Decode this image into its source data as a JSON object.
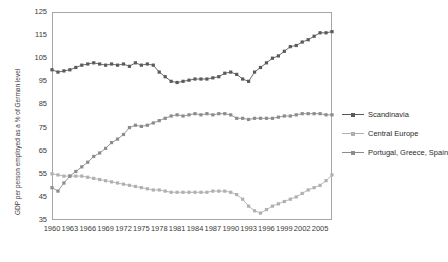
{
  "chart_data": {
    "type": "line",
    "title": "",
    "xlabel": "",
    "ylabel": "GDP per person employed as a % of German level",
    "ylim": [
      35,
      125
    ],
    "yticks": [
      35,
      45,
      55,
      65,
      75,
      85,
      95,
      105,
      115,
      125
    ],
    "xlim": [
      1960,
      2007
    ],
    "xticks": [
      1960,
      1963,
      1966,
      1969,
      1972,
      1975,
      1978,
      1981,
      1984,
      1987,
      1990,
      1993,
      1996,
      1999,
      2002,
      2005
    ],
    "grid": "horizontal",
    "legend_position": "right",
    "x": [
      1960,
      1961,
      1962,
      1963,
      1964,
      1965,
      1966,
      1967,
      1968,
      1969,
      1970,
      1971,
      1972,
      1973,
      1974,
      1975,
      1976,
      1977,
      1978,
      1979,
      1980,
      1981,
      1982,
      1983,
      1984,
      1985,
      1986,
      1987,
      1988,
      1989,
      1990,
      1991,
      1992,
      1993,
      1994,
      1995,
      1996,
      1997,
      1998,
      1999,
      2000,
      2001,
      2002,
      2003,
      2004,
      2005,
      2006,
      2007
    ],
    "series": [
      {
        "name": "Scandinavia",
        "color": "#5a5a5a",
        "values": [
          100,
          99,
          99.5,
          100,
          101,
          102,
          102.5,
          103,
          102.5,
          102,
          102.5,
          102,
          102.5,
          101.5,
          103,
          102,
          102.5,
          102,
          99,
          97,
          95,
          94.5,
          95,
          95.5,
          96,
          96,
          96,
          96.5,
          97,
          98.5,
          99,
          98,
          96,
          95,
          99,
          101,
          103,
          105,
          106,
          108,
          110,
          110.5,
          112,
          113,
          114.5,
          116,
          116,
          116.5
        ]
      },
      {
        "name": "Central Europe",
        "color": "#b0b0b0",
        "values": [
          55,
          54.5,
          54,
          54,
          54,
          54,
          53.5,
          53,
          52.5,
          52,
          51.5,
          51,
          50.5,
          50,
          49.5,
          49,
          48.5,
          48,
          48,
          47.5,
          47,
          47,
          47,
          47,
          47,
          47,
          47,
          47.5,
          47.5,
          47.5,
          47,
          46,
          44,
          41,
          39,
          38,
          39.5,
          41,
          42,
          43,
          44,
          45,
          46.5,
          48,
          49,
          50,
          52,
          54.5
        ]
      },
      {
        "name": "Portugal, Greece, Spain",
        "color": "#8c8c8c",
        "values": [
          49,
          47.5,
          51,
          54,
          56,
          58,
          60,
          62.5,
          64,
          66,
          68.5,
          70,
          72,
          75,
          76,
          75.5,
          76,
          77,
          78,
          79,
          80,
          80.5,
          80,
          80.5,
          81,
          80.5,
          81,
          80.5,
          81,
          81,
          80.5,
          79,
          79,
          78.5,
          79,
          79,
          79,
          79,
          79.5,
          80,
          80,
          80.5,
          81,
          81,
          81,
          81,
          80.5,
          80.5
        ]
      }
    ]
  },
  "legend": {
    "items": [
      {
        "label": "Scandinavia"
      },
      {
        "label": "Central Europe"
      },
      {
        "label": "Portugal, Greece, Spain"
      }
    ]
  }
}
